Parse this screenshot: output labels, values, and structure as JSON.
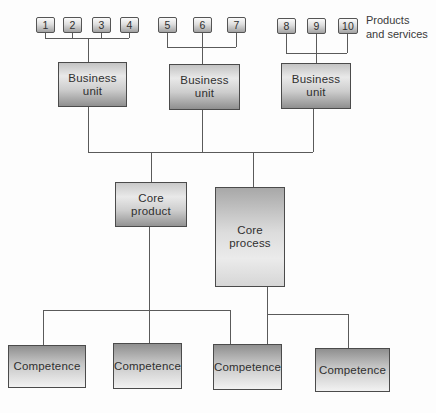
{
  "annotation": {
    "line1": "Products",
    "line2": "and services"
  },
  "product_boxes": [
    "1",
    "2",
    "3",
    "4",
    "5",
    "6",
    "7",
    "8",
    "9",
    "10"
  ],
  "business_units": [
    {
      "line1": "Business",
      "line2": "unit"
    },
    {
      "line1": "Business",
      "line2": "unit"
    },
    {
      "line1": "Business",
      "line2": "unit"
    }
  ],
  "core_product": {
    "line1": "Core",
    "line2": "product"
  },
  "core_process": {
    "line1": "Core",
    "line2": "process"
  },
  "competences": [
    "Competence",
    "Competence",
    "Competence",
    "Competence"
  ],
  "colors": {
    "box_border": "#4b4b4b",
    "connector_line": "#5a5a5a",
    "gradient_dark": "#8f8f8f",
    "gradient_light": "#f2f2f2",
    "text": "#2f2f2f"
  }
}
